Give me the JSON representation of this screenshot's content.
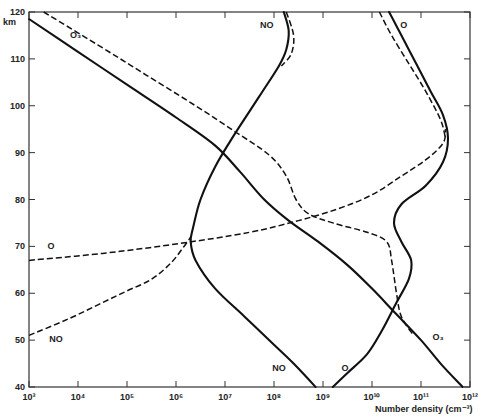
{
  "chart_data": {
    "type": "line",
    "title": "",
    "xlabel": "Number density (cm⁻³)",
    "ylabel": "km",
    "xscale": "log",
    "xlim_log10": [
      3,
      12
    ],
    "ylim": [
      40,
      120
    ],
    "grid": false,
    "x_tick_labels": [
      "10³",
      "10⁴",
      "10⁵",
      "10⁶",
      "10⁷",
      "10⁸",
      "10⁹",
      "10¹⁰",
      "10¹¹",
      "10¹²"
    ],
    "y_ticks": [
      40,
      50,
      60,
      70,
      80,
      90,
      100,
      110,
      120
    ],
    "series": [
      {
        "name": "O3 (solid)",
        "style": "solid",
        "points_log10_km": [
          [
            3.0,
            118.5
          ],
          [
            4.0,
            111.5
          ],
          [
            5.0,
            104.5
          ],
          [
            6.0,
            97.5
          ],
          [
            6.8,
            91.5
          ],
          [
            7.3,
            86
          ],
          [
            7.8,
            80
          ],
          [
            8.3,
            75.5
          ],
          [
            8.9,
            71
          ],
          [
            9.5,
            66
          ],
          [
            10.0,
            61
          ],
          [
            10.5,
            55.5
          ],
          [
            11.0,
            50
          ],
          [
            11.4,
            45
          ],
          [
            11.85,
            40
          ]
        ]
      },
      {
        "name": "O3 (dashed)",
        "style": "dashed",
        "points_log10_km": [
          [
            3.3,
            120
          ],
          [
            4.4,
            113
          ],
          [
            5.4,
            106.5
          ],
          [
            6.4,
            100
          ],
          [
            7.2,
            94.5
          ],
          [
            7.9,
            89.5
          ],
          [
            8.25,
            85
          ],
          [
            8.45,
            80
          ],
          [
            8.7,
            77
          ],
          [
            9.2,
            75
          ],
          [
            9.9,
            73
          ],
          [
            10.3,
            71
          ],
          [
            10.4,
            67
          ],
          [
            10.5,
            60
          ],
          [
            10.6,
            55
          ],
          [
            10.85,
            51
          ]
        ]
      },
      {
        "name": "NO (solid)",
        "style": "solid",
        "points_log10_km": [
          [
            8.2,
            120
          ],
          [
            8.3,
            116
          ],
          [
            8.25,
            112
          ],
          [
            8.1,
            108.5
          ],
          [
            7.7,
            102
          ],
          [
            7.2,
            94
          ],
          [
            6.8,
            87
          ],
          [
            6.5,
            80
          ],
          [
            6.35,
            74
          ],
          [
            6.3,
            71
          ],
          [
            6.4,
            67
          ],
          [
            6.8,
            61
          ],
          [
            7.4,
            55
          ],
          [
            8.0,
            49
          ],
          [
            8.4,
            45
          ],
          [
            8.85,
            40
          ]
        ]
      },
      {
        "name": "NO (dashed)",
        "style": "dashed",
        "points_log10_km": [
          [
            8.25,
            120
          ],
          [
            8.4,
            115
          ],
          [
            8.35,
            111
          ],
          [
            8.15,
            108.5
          ]
        ]
      },
      {
        "name": "NO (dashed, lower)",
        "style": "dashed",
        "points_log10_km": [
          [
            3.0,
            51
          ],
          [
            3.8,
            54.5
          ],
          [
            4.5,
            58
          ],
          [
            5.0,
            60.5
          ],
          [
            5.5,
            63
          ],
          [
            5.9,
            66.5
          ],
          [
            6.2,
            70.5
          ],
          [
            6.3,
            72
          ]
        ]
      },
      {
        "name": "O (dashed, lower)",
        "style": "dashed",
        "points_log10_km": [
          [
            3.0,
            67
          ],
          [
            4.5,
            68.5
          ],
          [
            6.0,
            70.5
          ],
          [
            7.5,
            73
          ],
          [
            8.5,
            75.5
          ],
          [
            9.3,
            78
          ],
          [
            10.0,
            81
          ],
          [
            10.6,
            85
          ],
          [
            11.1,
            88.5
          ],
          [
            11.45,
            92
          ],
          [
            11.5,
            95
          ]
        ]
      },
      {
        "name": "O (solid)",
        "style": "solid",
        "points_log10_km": [
          [
            9.2,
            40
          ],
          [
            9.5,
            43
          ],
          [
            9.9,
            47
          ],
          [
            10.2,
            52
          ],
          [
            10.5,
            58
          ],
          [
            10.75,
            63
          ],
          [
            10.8,
            67
          ],
          [
            10.6,
            71
          ],
          [
            10.45,
            75
          ],
          [
            10.6,
            79
          ],
          [
            11.1,
            83
          ],
          [
            11.45,
            88
          ],
          [
            11.55,
            93
          ],
          [
            11.45,
            98
          ],
          [
            11.2,
            103
          ],
          [
            10.9,
            109
          ],
          [
            10.55,
            116
          ],
          [
            10.35,
            120
          ]
        ]
      },
      {
        "name": "O (dashed, upper)",
        "style": "dashed",
        "points_log10_km": [
          [
            10.15,
            120
          ],
          [
            10.4,
            115
          ],
          [
            10.75,
            109
          ],
          [
            11.1,
            103
          ],
          [
            11.4,
            97
          ],
          [
            11.5,
            93
          ]
        ]
      }
    ],
    "annotations": [
      {
        "text": "O₃",
        "log10": 3.95,
        "km": 114.5
      },
      {
        "text": "NO",
        "log10": 7.85,
        "km": 116.5
      },
      {
        "text": "O",
        "log10": 10.65,
        "km": 116.5
      },
      {
        "text": "O",
        "log10": 3.45,
        "km": 69.5
      },
      {
        "text": "NO",
        "log10": 3.55,
        "km": 49.5
      },
      {
        "text": "NO",
        "log10": 8.1,
        "km": 43.5
      },
      {
        "text": "O",
        "log10": 9.45,
        "km": 43.5
      },
      {
        "text": "O₃",
        "log10": 11.35,
        "km": 50
      }
    ]
  }
}
